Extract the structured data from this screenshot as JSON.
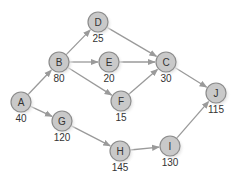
{
  "diagram": {
    "type": "network-activity-graph",
    "colors": {
      "node_fill": "#c9c9c9",
      "node_stroke": "#8c8c8c",
      "edge": "#9a9a9a",
      "text": "#333333",
      "shadow": "#e2e2e2"
    },
    "nodes": [
      {
        "id": "A",
        "label": "A",
        "value": "40",
        "x": 21,
        "y": 102
      },
      {
        "id": "B",
        "label": "B",
        "value": "80",
        "x": 59,
        "y": 62
      },
      {
        "id": "D",
        "label": "D",
        "value": "25",
        "x": 98,
        "y": 22
      },
      {
        "id": "E",
        "label": "E",
        "value": "20",
        "x": 109,
        "y": 62
      },
      {
        "id": "C",
        "label": "C",
        "value": "30",
        "x": 166,
        "y": 62
      },
      {
        "id": "F",
        "label": "F",
        "value": "15",
        "x": 121,
        "y": 101
      },
      {
        "id": "G",
        "label": "G",
        "value": "120",
        "x": 62,
        "y": 121
      },
      {
        "id": "H",
        "label": "H",
        "value": "145",
        "x": 120,
        "y": 151
      },
      {
        "id": "I",
        "label": "I",
        "value": "130",
        "x": 170,
        "y": 146
      },
      {
        "id": "J",
        "label": "J",
        "value": "115",
        "x": 216,
        "y": 93
      }
    ],
    "edges": [
      {
        "from": "A",
        "to": "B"
      },
      {
        "from": "A",
        "to": "G"
      },
      {
        "from": "B",
        "to": "D"
      },
      {
        "from": "B",
        "to": "E"
      },
      {
        "from": "B",
        "to": "F"
      },
      {
        "from": "D",
        "to": "C"
      },
      {
        "from": "E",
        "to": "C"
      },
      {
        "from": "F",
        "to": "C"
      },
      {
        "from": "C",
        "to": "J"
      },
      {
        "from": "G",
        "to": "H"
      },
      {
        "from": "H",
        "to": "I"
      },
      {
        "from": "I",
        "to": "J"
      }
    ]
  }
}
